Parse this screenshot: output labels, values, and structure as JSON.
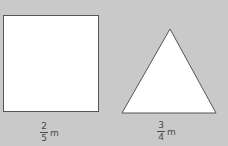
{
  "colors": {
    "background": "#c9c9c9",
    "shape_fill": "#ffffff",
    "shape_stroke": "#555555",
    "text": "#4a4a4a"
  },
  "shapes": [
    {
      "type": "square",
      "label": {
        "numerator": "2",
        "denominator": "5",
        "unit": "m"
      }
    },
    {
      "type": "triangle",
      "label": {
        "numerator": "3",
        "denominator": "4",
        "unit": "m"
      }
    }
  ]
}
